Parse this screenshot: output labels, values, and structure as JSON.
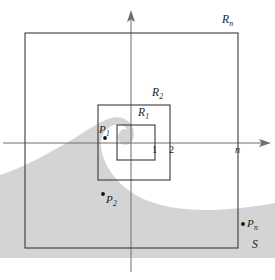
{
  "figure": {
    "colors": {
      "stroke": "#3a3a3a",
      "axis": "#6e6e6e",
      "shade": "#d4d4d4",
      "text": "#1b1b1b",
      "background": "#ffffff"
    }
  },
  "rectangles": [
    {
      "name": "R1",
      "letter": "R",
      "subscript": "1",
      "x": 117,
      "y": 125,
      "width": 38,
      "height": 35
    },
    {
      "name": "R2",
      "letter": "R",
      "subscript": "2",
      "x": 98,
      "y": 105,
      "width": 72,
      "height": 75
    },
    {
      "name": "Rn",
      "letter": "R",
      "subscript": "n",
      "x": 25,
      "y": 33,
      "width": 213,
      "height": 215
    }
  ],
  "labels": {
    "rn": {
      "letter": "R",
      "subscript": "n"
    },
    "r2": {
      "letter": "R",
      "subscript": "2"
    },
    "r1": {
      "letter": "R",
      "subscript": "1"
    },
    "p1": {
      "letter": "P",
      "subscript": "1"
    },
    "p2": {
      "letter": "P",
      "subscript": "2"
    },
    "pn": {
      "letter": "P",
      "subscript": "n"
    },
    "region": "S",
    "tick1": "1",
    "tick2": "2",
    "axis_n": "n"
  },
  "points": [
    {
      "name": "P1",
      "letter": "P",
      "subscript": "1",
      "cx": 105,
      "cy": 138
    },
    {
      "name": "P2",
      "letter": "P",
      "subscript": "2",
      "cx": 103,
      "cy": 194
    },
    {
      "name": "Pn",
      "letter": "P",
      "subscript": "n",
      "cx": 243,
      "cy": 224
    }
  ],
  "axes": {
    "x_axis": {
      "y": 143,
      "x_start": 3,
      "x_end": 271
    },
    "y_axis": {
      "x": 131,
      "y_start": 10,
      "y_end": 272
    },
    "ticks": [
      {
        "label": "1",
        "x": 155
      },
      {
        "label": "2",
        "x": 172
      }
    ],
    "n_mark": {
      "label": "n",
      "x": 238
    }
  },
  "shaded_region": {
    "name": "S",
    "fill": "#d4d4d4",
    "description": "Spiral region curling around the origin, filling the lower-left and sweeping along the bottom to the right edge"
  }
}
